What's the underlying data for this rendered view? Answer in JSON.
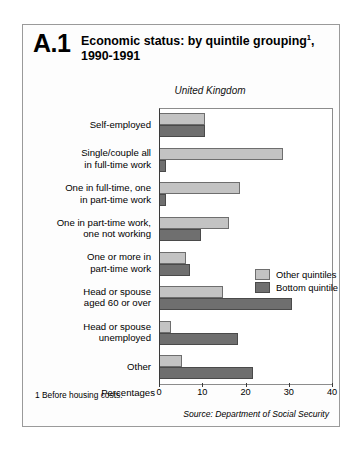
{
  "figure": {
    "number": "A.1",
    "title_line1": "Economic status: by quintile grouping",
    "title_sup": "1",
    "title_line1_tail": ",",
    "title_line2": "1990-1991",
    "region": "United Kingdom",
    "footnote": "1  Before housing costs.",
    "source": "Source: Department of Social Security"
  },
  "chart_data": {
    "type": "bar",
    "orientation": "horizontal",
    "subtitle": "United Kingdom",
    "xlabel": "Percentages",
    "ylabel": "",
    "xlim": [
      0,
      40
    ],
    "xticks": [
      0,
      10,
      20,
      30,
      40
    ],
    "grid": false,
    "legend_position": "middle-right-inside",
    "categories": [
      "Self-employed",
      "Single/couple all in full-time work",
      "One in full-time, one in part-time work",
      "One in part-time work, one not working",
      "One or more in part-time work",
      "Head or spouse aged 60 or over",
      "Head or spouse unemployed",
      "Other"
    ],
    "category_lines": [
      [
        "Self-employed"
      ],
      [
        "Single/couple all",
        "in full-time work"
      ],
      [
        "One in full-time, one",
        "in part-time work"
      ],
      [
        "One in part-time work,",
        "one not working"
      ],
      [
        "One or more in",
        "part-time work"
      ],
      [
        "Head or spouse",
        "aged 60 or over"
      ],
      [
        "Head or spouse",
        "unemployed"
      ],
      [
        "Other"
      ]
    ],
    "series": [
      {
        "name": "Other quintiles",
        "color": "#c3c3c3",
        "values": [
          10.5,
          28.5,
          18.5,
          16.0,
          6.0,
          14.5,
          2.5,
          5.0
        ]
      },
      {
        "name": "Bottom quintile",
        "color": "#6f6f6f",
        "values": [
          10.5,
          1.5,
          1.5,
          9.5,
          7.0,
          30.5,
          18.0,
          21.5
        ]
      }
    ]
  }
}
